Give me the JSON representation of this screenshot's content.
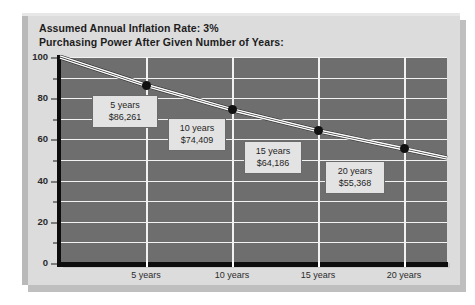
{
  "header": {
    "line1": "Assumed Annual Inflation Rate: 3%",
    "line2": "Purchasing Power After Given Number of Years:"
  },
  "chart_data": {
    "type": "line",
    "title": "Purchasing Power After Given Number of Years:",
    "subtitle": "Assumed Annual Inflation Rate: 3%",
    "xlabel": "",
    "ylabel": "",
    "xlim": [
      0,
      22.5
    ],
    "ylim": [
      0,
      100
    ],
    "grid": true,
    "legend": "none",
    "x": [
      0,
      5,
      10,
      15,
      20
    ],
    "y": [
      100,
      86.261,
      74.409,
      64.186,
      55.368
    ],
    "y_ticks": [
      "0",
      "20",
      "40",
      "60",
      "80",
      "100"
    ],
    "y_tick_values": [
      0,
      20,
      40,
      60,
      80,
      100
    ],
    "y_gridline_values": [
      0,
      10,
      20,
      30,
      40,
      50,
      60,
      70,
      80,
      90,
      100
    ],
    "x_ticks": [
      "5 years",
      "10 years",
      "15 years",
      "20 years"
    ],
    "x_tick_values": [
      5,
      10,
      15,
      20
    ],
    "series": [
      {
        "name": "Purchasing Power",
        "values": [
          100,
          86.261,
          74.409,
          64.186,
          55.368
        ]
      }
    ],
    "annotations": [
      {
        "years_label": "5 years",
        "amount_label": "$86,261",
        "x": 5,
        "y": 86.261
      },
      {
        "years_label": "10 years",
        "amount_label": "$74,409",
        "x": 10,
        "y": 74.409
      },
      {
        "years_label": "15 years",
        "amount_label": "$64,186",
        "x": 15,
        "y": 64.186
      },
      {
        "years_label": "20 years",
        "amount_label": "$55,368",
        "x": 20,
        "y": 55.368
      }
    ],
    "colors": {
      "plot_background": "#6e6e6e",
      "gridline": "#f2f2f2",
      "axis": "#0d0d0d",
      "series_line": "#ffffff",
      "marker": "#111111",
      "callout_background": "#e3e3e3",
      "card_background": "#dcdcdc"
    }
  }
}
